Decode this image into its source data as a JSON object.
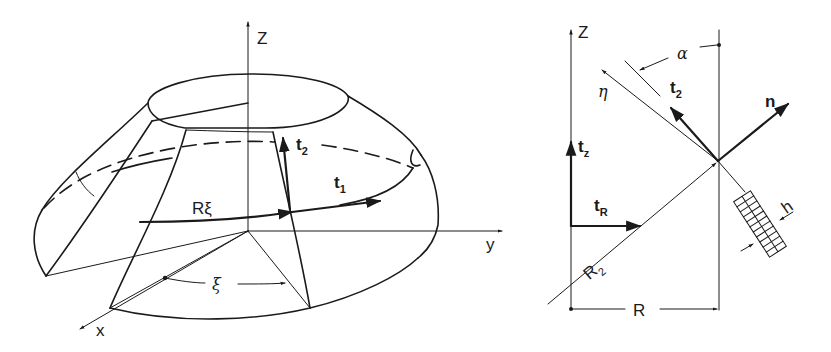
{
  "figure": {
    "left_diagram": {
      "title": "Conical shell segment in 3D coordinates",
      "axes": {
        "z_label": "Z",
        "y_label": "y",
        "x_label": "x"
      },
      "vectors": {
        "t2": {
          "main": "t",
          "sub": "2"
        },
        "t1": {
          "main": "t",
          "sub": "1"
        }
      },
      "arc_label": "Rξ",
      "angle_label": "ξ"
    },
    "right_diagram": {
      "title": "Meridional cross-section",
      "axes": {
        "z_label": "Z"
      },
      "vectors": {
        "tz": {
          "main": "t",
          "sub": "z"
        },
        "tR": {
          "main": "t",
          "sub": "R"
        },
        "t2": {
          "main": "t",
          "sub": "2"
        },
        "n": "n"
      },
      "labels": {
        "alpha": "α",
        "eta": "η",
        "h": "h",
        "R2": {
          "main": "R",
          "sub": "2"
        },
        "R": "R"
      }
    }
  }
}
